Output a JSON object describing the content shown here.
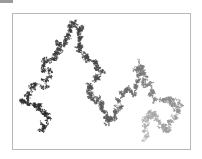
{
  "chart_data": {
    "type": "line",
    "title": "",
    "xlabel": "",
    "ylabel": "",
    "grid": false,
    "legend": "none",
    "colormap": {
      "start": "#262626",
      "mid": "#5a5a5a",
      "end": "#b4b4b4"
    },
    "frame": {
      "x": 12,
      "y": 13,
      "width": 179,
      "height": 137,
      "stroke": "#b8b8b8"
    },
    "waypoints": [
      [
        40,
        130
      ],
      [
        45,
        115
      ],
      [
        38,
        105
      ],
      [
        22,
        100
      ],
      [
        30,
        88
      ],
      [
        48,
        80
      ],
      [
        42,
        65
      ],
      [
        55,
        55
      ],
      [
        60,
        45
      ],
      [
        68,
        35
      ],
      [
        72,
        22
      ],
      [
        80,
        30
      ],
      [
        78,
        45
      ],
      [
        85,
        55
      ],
      [
        95,
        62
      ],
      [
        100,
        70
      ],
      [
        92,
        85
      ],
      [
        88,
        95
      ],
      [
        100,
        100
      ],
      [
        105,
        115
      ],
      [
        110,
        120
      ],
      [
        118,
        110
      ],
      [
        122,
        95
      ],
      [
        132,
        92
      ],
      [
        138,
        75
      ],
      [
        140,
        65
      ],
      [
        142,
        80
      ],
      [
        150,
        90
      ],
      [
        160,
        100
      ],
      [
        170,
        98
      ],
      [
        178,
        105
      ],
      [
        172,
        118
      ],
      [
        165,
        130
      ],
      [
        158,
        122
      ],
      [
        150,
        110
      ],
      [
        145,
        125
      ],
      [
        148,
        138
      ]
    ],
    "steps": 9000,
    "seed": 7
  },
  "decor": {
    "corner_bar_color": "#9a9a9a"
  }
}
